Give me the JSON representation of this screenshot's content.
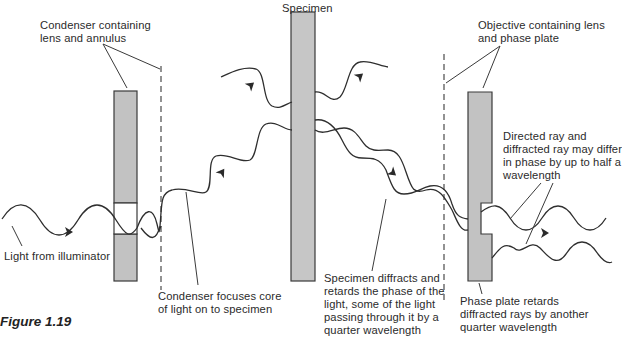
{
  "figure": {
    "caption": "Figure 1.19",
    "colors": {
      "bar_fill": "#c2c2c2",
      "bar_stroke": "#3a3a3a",
      "wave_stroke": "#2e2e2e",
      "dashed_line": "#3a3a3a",
      "text": "#2b2b2b",
      "background": "#ffffff"
    }
  },
  "labels": {
    "condenser": [
      "Condenser containing",
      "lens and annulus"
    ],
    "specimen": [
      "Specimen"
    ],
    "objective": [
      "Objective containing lens",
      "and phase plate"
    ],
    "directed_ray": [
      "Directed ray and",
      "diffracted ray may differ",
      "in phase by up to half a",
      "wavelength"
    ],
    "light_source": [
      "Light from illuminator"
    ],
    "condenser_focus": [
      "Condenser focuses core",
      "of light on to specimen"
    ],
    "specimen_diffracts": [
      "Specimen diffracts and",
      "retards the phase of the",
      "light, some of the light",
      "passing through it by a",
      "quarter wavelength"
    ],
    "phase_plate": [
      "Phase plate retards",
      "diffracted rays by another",
      "quarter wavelength"
    ]
  },
  "components": [
    {
      "name": "condenser",
      "type": "bar-with-annulus-opening"
    },
    {
      "name": "condenser-focal-plane",
      "type": "dashed-line"
    },
    {
      "name": "specimen",
      "type": "bar"
    },
    {
      "name": "objective-focal-plane",
      "type": "dashed-line"
    },
    {
      "name": "objective",
      "type": "bar-with-phase-plate-notch"
    }
  ],
  "icons": {
    "direction_arrow": "arrow-right-icon"
  }
}
